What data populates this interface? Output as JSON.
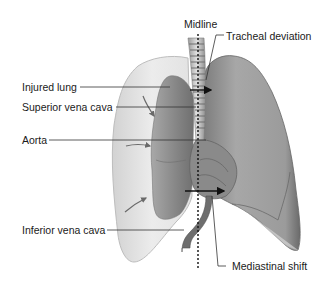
{
  "diagram": {
    "labels": {
      "midline": "Midline",
      "tracheal_deviation": "Tracheal deviation",
      "injured_lung": "Injured lung",
      "superior_vena_cava": "Superior vena cava",
      "aorta": "Aorta",
      "inferior_vena_cava": "Inferior vena cava",
      "mediastinal_shift": "Mediastinal shift"
    },
    "colors": {
      "background": "#ffffff",
      "pleural_space": "#e9e9e9",
      "collapsed_lung": "#8c8c8c",
      "healthy_lung": "#9a9a9a",
      "vessel": "#6e6e6e",
      "leader_line": "#333333",
      "arrow": "#111111"
    }
  }
}
